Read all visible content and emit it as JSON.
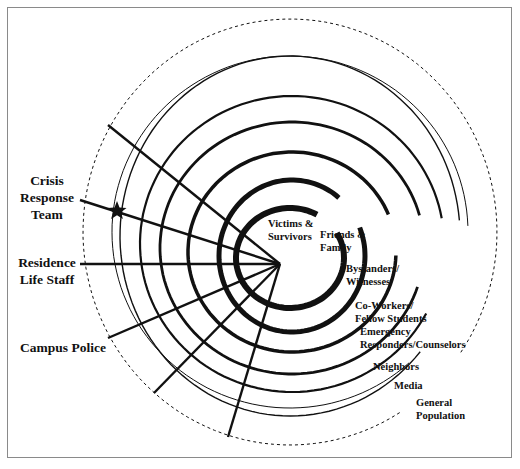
{
  "diagram": {
    "center": {
      "x": 280,
      "y": 264
    },
    "colors": {
      "stroke": "#111111",
      "frame": "#8a8a8a",
      "background": "#ffffff"
    },
    "rings": [
      {
        "label": "Victims & Survivors",
        "lines": [
          "Victims &",
          "Survivors"
        ],
        "cx": 290,
        "cy": 258,
        "rx": 54,
        "ry": 50,
        "width": 6,
        "style": "solid",
        "start_deg": -30,
        "end_deg": 300,
        "label_pos": {
          "x": 268,
          "y": 218
        }
      },
      {
        "label": "Friends & Family",
        "lines": [
          "Friends &",
          "Family"
        ],
        "cx": 292,
        "cy": 256,
        "rx": 73,
        "ry": 76,
        "width": 5,
        "style": "solid",
        "start_deg": -22,
        "end_deg": 310,
        "label_pos": {
          "x": 320,
          "y": 229
        }
      },
      {
        "label": "Bystanders/ Witnesses",
        "lines": [
          "Bystanders/",
          "Witnesses"
        ],
        "cx": 292,
        "cy": 252,
        "rx": 104,
        "ry": 100,
        "width": 3.5,
        "style": "solid",
        "start_deg": 2,
        "end_deg": 338,
        "label_pos": {
          "x": 346,
          "y": 263
        }
      },
      {
        "label": "Co-Workers/ Fellow Students",
        "lines": [
          "Co-Workers/",
          "Fellow Students"
        ],
        "cx": 292,
        "cy": 248,
        "rx": 132,
        "ry": 126,
        "width": 2.8,
        "style": "solid",
        "start_deg": 18,
        "end_deg": 345,
        "label_pos": {
          "x": 355,
          "y": 300
        }
      },
      {
        "label": "Emergency Responders/Counselors",
        "lines": [
          "Emergency",
          "Responders/Counselors"
        ],
        "cx": 292,
        "cy": 244,
        "rx": 152,
        "ry": 148,
        "width": 2.2,
        "style": "solid",
        "start_deg": 28,
        "end_deg": 350,
        "label_pos": {
          "x": 360,
          "y": 326
        }
      },
      {
        "label": "Neighbors",
        "lines": [
          "Neighbors"
        ],
        "cx": 290,
        "cy": 236,
        "rx": 170,
        "ry": 180,
        "width": 1.4,
        "style": "solid",
        "start_deg": 40,
        "end_deg": 355,
        "label_pos": {
          "x": 373,
          "y": 361
        }
      },
      {
        "label": "Media",
        "lines": [
          "Media"
        ],
        "cx": 290,
        "cy": 232,
        "rx": 178,
        "ry": 176,
        "width": 1,
        "style": "solid",
        "start_deg": 48,
        "end_deg": 358,
        "label_pos": {
          "x": 394,
          "y": 380
        }
      },
      {
        "label": "General Population",
        "lines": [
          "General",
          "Population"
        ],
        "cx": 290,
        "cy": 232,
        "rx": 207,
        "ry": 213,
        "width": 1,
        "style": "dashed",
        "start_deg": 58,
        "end_deg": 395,
        "label_pos": {
          "x": 416,
          "y": 397
        }
      }
    ],
    "rays": [
      {
        "x": 108,
        "y": 125
      },
      {
        "x": 80,
        "y": 200
      },
      {
        "x": 80,
        "y": 264
      },
      {
        "x": 108,
        "y": 338
      },
      {
        "x": 154,
        "y": 393
      },
      {
        "x": 228,
        "y": 437
      }
    ],
    "star": {
      "x": 117,
      "y": 211,
      "size": 10
    },
    "responders": [
      {
        "label": "Crisis Response Team",
        "lines": [
          "Crisis",
          "Response",
          "Team"
        ],
        "x": 14,
        "y": 173,
        "w": 66
      },
      {
        "label": "Residence Life Staff",
        "lines": [
          "Residence",
          "Life Staff"
        ],
        "x": 14,
        "y": 255,
        "w": 66
      },
      {
        "label": "Campus Police",
        "lines": [
          "Campus Police"
        ],
        "x": 20,
        "y": 340,
        "w": 80
      }
    ]
  }
}
